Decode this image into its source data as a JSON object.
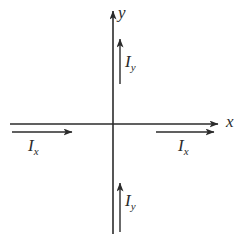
{
  "figure": {
    "background_color": "#ffffff",
    "stroke_color": "#2b2b2b",
    "width": 250,
    "height": 234,
    "origin": {
      "x": 113,
      "y": 124
    }
  },
  "axes": {
    "x_axis": {
      "label": "x",
      "label_name": "x-axis-label",
      "label_x": 226,
      "label_y": 113,
      "start": {
        "x": 10,
        "y": 124
      },
      "end": {
        "x": 218,
        "y": 124
      },
      "arrow_at": "end"
    },
    "y_axis": {
      "label": "y",
      "label_name": "y-axis-label",
      "label_x": 118,
      "label_y": 4,
      "start": {
        "x": 113,
        "y": 234
      },
      "end": {
        "x": 113,
        "y": 11
      },
      "arrow_at": "end"
    }
  },
  "vectors": [
    {
      "name": "current-arrow-ix-left",
      "label": "I",
      "subscript": "x",
      "label_x": 28,
      "label_y": 137,
      "tail": {
        "x": 12,
        "y": 132
      },
      "tip": {
        "x": 72,
        "y": 132
      },
      "direction": "right"
    },
    {
      "name": "current-arrow-ix-right",
      "label": "I",
      "subscript": "x",
      "label_x": 178,
      "label_y": 137,
      "tail": {
        "x": 156,
        "y": 132
      },
      "tip": {
        "x": 214,
        "y": 132
      },
      "direction": "right"
    },
    {
      "name": "current-arrow-iy-upper",
      "label": "I",
      "subscript": "y",
      "label_x": 125,
      "label_y": 53,
      "tail": {
        "x": 120,
        "y": 84
      },
      "tip": {
        "x": 120,
        "y": 39
      },
      "direction": "up"
    },
    {
      "name": "current-arrow-iy-lower",
      "label": "I",
      "subscript": "y",
      "label_x": 125,
      "label_y": 192,
      "tail": {
        "x": 120,
        "y": 232
      },
      "tip": {
        "x": 120,
        "y": 183
      },
      "direction": "up"
    }
  ]
}
